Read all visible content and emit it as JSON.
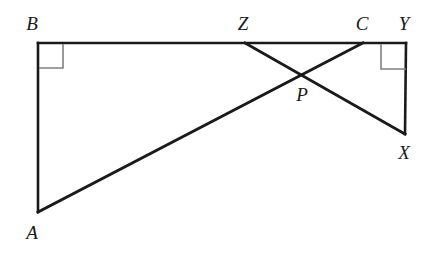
{
  "figure": {
    "type": "geometry-diagram",
    "width": 437,
    "height": 253,
    "background_color": "#ffffff",
    "stroke_color": "#1a1a1a",
    "right_angle_mark_color": "#808080",
    "label_color": "#1a1a1a"
  },
  "points": {
    "A": {
      "label": "A",
      "x": 38,
      "y": 212,
      "label_x": 32,
      "label_y": 232
    },
    "B": {
      "label": "B",
      "x": 38,
      "y": 43,
      "label_x": 32,
      "label_y": 23
    },
    "C": {
      "label": "C",
      "x": 363,
      "y": 43,
      "label_x": 362,
      "label_y": 23
    },
    "P": {
      "label": "P",
      "x": 300,
      "y": 74,
      "label_x": 302,
      "label_y": 94
    },
    "X": {
      "label": "X",
      "x": 405,
      "y": 134,
      "label_x": 404,
      "label_y": 152
    },
    "Y": {
      "label": "Y",
      "x": 406,
      "y": 43,
      "label_x": 404,
      "label_y": 23
    },
    "Z": {
      "label": "Z",
      "x": 245,
      "y": 43,
      "label_x": 243,
      "label_y": 23
    }
  },
  "segments": [
    {
      "name": "segment-BY",
      "from": "B",
      "to": "Y",
      "width": 2.6
    },
    {
      "name": "segment-BA",
      "from": "B",
      "to": "A",
      "width": 2.6
    },
    {
      "name": "segment-AC",
      "from": "A",
      "to": "C",
      "width": 2.8
    },
    {
      "name": "segment-ZX",
      "from": "Z",
      "to": "X",
      "width": 2.8
    },
    {
      "name": "segment-XY",
      "from": "X",
      "to": "Y",
      "width": 2.6
    }
  ],
  "right_angles": [
    {
      "name": "right-angle-at-B",
      "vertex": "B",
      "x": 39,
      "y": 44,
      "size": 24,
      "dir_x": 1,
      "dir_y": 1
    },
    {
      "name": "right-angle-at-Y",
      "vertex": "Y",
      "x": 406,
      "y": 44,
      "size": 25,
      "dir_x": -1,
      "dir_y": 1
    }
  ],
  "labels": {
    "A": "A",
    "B": "B",
    "C": "C",
    "P": "P",
    "X": "X",
    "Y": "Y",
    "Z": "Z"
  }
}
